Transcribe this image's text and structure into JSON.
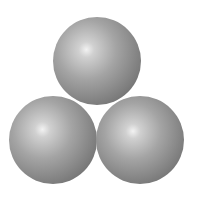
{
  "scene": {
    "description": "Three gray shaded spheres stacked in a triangular arrangement",
    "background": "#ffffff",
    "colors": {
      "highlight": "#f2f2f2",
      "mid": "#a4a4a4",
      "shade": "#7c7c7c",
      "edge": "#565656"
    },
    "spheres": [
      {
        "name": "top",
        "cx": 97,
        "cy": 61,
        "r": 44,
        "hx": 38,
        "hy": 37
      },
      {
        "name": "bottom-left",
        "cx": 53,
        "cy": 140,
        "r": 44,
        "hx": 38,
        "hy": 38
      },
      {
        "name": "bottom-right",
        "cx": 140,
        "cy": 140,
        "r": 44,
        "hx": 42,
        "hy": 40
      }
    ]
  }
}
